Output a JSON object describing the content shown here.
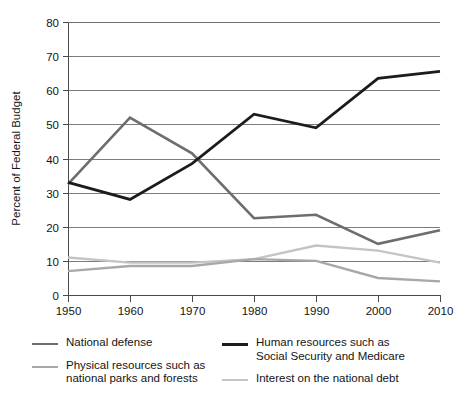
{
  "chart_data": {
    "type": "line",
    "title": "",
    "xlabel": "",
    "ylabel": "Percent of Federal Budget",
    "x": [
      1950,
      1960,
      1970,
      1980,
      1990,
      2000,
      2010
    ],
    "xtick_labels": [
      "1950",
      "1960",
      "1970",
      "1980",
      "1990",
      "2000",
      "2010"
    ],
    "ytick_labels": [
      "0",
      "10",
      "20",
      "30",
      "40",
      "50",
      "60",
      "70",
      "80"
    ],
    "yticks": [
      0,
      10,
      20,
      30,
      40,
      50,
      60,
      70,
      80
    ],
    "xlim": [
      1950,
      2010
    ],
    "ylim": [
      0,
      80
    ],
    "grid": "horizontal",
    "legend_position": "bottom",
    "series": [
      {
        "name": "National defense",
        "color": "#6d6d6d",
        "width": 2.6,
        "values": [
          32.5,
          52,
          41.5,
          22.5,
          23.5,
          15,
          19
        ]
      },
      {
        "name": "Human resources such as\nSocial Security and Medicare",
        "color": "#1c1c1c",
        "width": 2.8,
        "values": [
          33,
          28,
          38.5,
          53,
          49,
          63.5,
          65.5
        ]
      },
      {
        "name": "Physical resources such as\nnational parks and forests",
        "color": "#a8a8a8",
        "width": 2.4,
        "values": [
          7,
          8.5,
          8.5,
          10.5,
          10,
          5,
          4
        ]
      },
      {
        "name": "Interest on the national debt",
        "color": "#c4c4c4",
        "width": 2.4,
        "values": [
          11,
          9.5,
          9.5,
          10.5,
          14.5,
          13,
          9.5
        ]
      }
    ]
  },
  "legend": {
    "items": [
      {
        "label": "National defense",
        "color": "#6d6d6d",
        "width": 2.6
      },
      {
        "label": "Human resources such as\nSocial Security and Medicare",
        "color": "#1c1c1c",
        "width": 3.2
      },
      {
        "label": "Physical resources such as\nnational parks and forests",
        "color": "#a8a8a8",
        "width": 2.6
      },
      {
        "label": "Interest on the national debt",
        "color": "#c4c4c4",
        "width": 2.6
      }
    ]
  }
}
